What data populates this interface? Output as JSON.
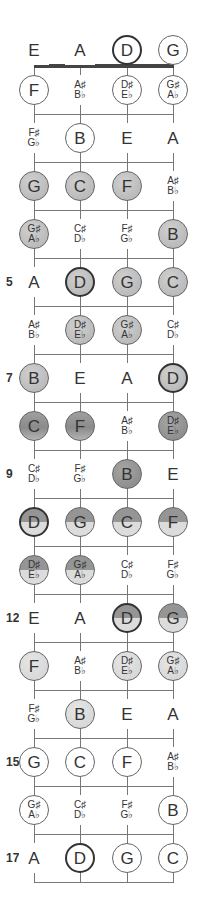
{
  "diagram": {
    "strings": [
      "E",
      "A",
      "D",
      "G"
    ],
    "string_x": [
      34,
      80,
      127,
      173
    ],
    "open_row_y": 50,
    "first_row_y": 90,
    "row_spacing": 48,
    "fills": {
      "white": "#ffffff",
      "light": "#dcdcdc",
      "mid": "#c0c0c0",
      "dark": "#8a8a8a",
      "split_top": "#959595",
      "split_bottom": "#dcdcdc"
    },
    "fret_numbers": [
      {
        "fret": 5,
        "label": "5"
      },
      {
        "fret": 7,
        "label": "7"
      },
      {
        "fret": 9,
        "label": "9"
      },
      {
        "fret": 12,
        "label": "12"
      },
      {
        "fret": 15,
        "label": "15"
      },
      {
        "fret": 17,
        "label": "17"
      }
    ],
    "rows": [
      {
        "fret": 0,
        "notes": [
          {
            "name": "E",
            "circle": false
          },
          {
            "name": "A",
            "circle": false
          },
          {
            "name": "D",
            "circle": true,
            "root": true,
            "fill": "white"
          },
          {
            "name": "G",
            "circle": true,
            "fill": "white"
          }
        ]
      },
      {
        "fret": 1,
        "notes": [
          {
            "name": "F",
            "circle": true,
            "fill": "white"
          },
          {
            "sharp": "A♯",
            "flat": "B♭",
            "circle": false
          },
          {
            "sharp": "D♯",
            "flat": "E♭",
            "circle": true,
            "fill": "white"
          },
          {
            "sharp": "G♯",
            "flat": "A♭",
            "circle": true,
            "fill": "white"
          }
        ]
      },
      {
        "fret": 2,
        "notes": [
          {
            "sharp": "F♯",
            "flat": "G♭",
            "circle": false
          },
          {
            "name": "B",
            "circle": true,
            "fill": "white"
          },
          {
            "name": "E",
            "circle": false
          },
          {
            "name": "A",
            "circle": false
          }
        ]
      },
      {
        "fret": 3,
        "notes": [
          {
            "name": "G",
            "circle": true,
            "fill": "mid"
          },
          {
            "name": "C",
            "circle": true,
            "fill": "mid"
          },
          {
            "name": "F",
            "circle": true,
            "fill": "mid"
          },
          {
            "sharp": "A♯",
            "flat": "B♭",
            "circle": false
          }
        ]
      },
      {
        "fret": 4,
        "notes": [
          {
            "sharp": "G♯",
            "flat": "A♭",
            "circle": true,
            "fill": "mid"
          },
          {
            "sharp": "C♯",
            "flat": "D♭",
            "circle": false
          },
          {
            "sharp": "F♯",
            "flat": "G♭",
            "circle": false
          },
          {
            "name": "B",
            "circle": true,
            "fill": "mid"
          }
        ]
      },
      {
        "fret": 5,
        "notes": [
          {
            "name": "A",
            "circle": false
          },
          {
            "name": "D",
            "circle": true,
            "root": true,
            "fill": "mid"
          },
          {
            "name": "G",
            "circle": true,
            "fill": "mid"
          },
          {
            "name": "C",
            "circle": true,
            "fill": "mid"
          }
        ]
      },
      {
        "fret": 6,
        "notes": [
          {
            "sharp": "A♯",
            "flat": "B♭",
            "circle": false
          },
          {
            "sharp": "D♯",
            "flat": "E♭",
            "circle": true,
            "fill": "mid"
          },
          {
            "sharp": "G♯",
            "flat": "A♭",
            "circle": true,
            "fill": "mid"
          },
          {
            "sharp": "C♯",
            "flat": "D♭",
            "circle": false
          }
        ]
      },
      {
        "fret": 7,
        "notes": [
          {
            "name": "B",
            "circle": true,
            "fill": "mid"
          },
          {
            "name": "E",
            "circle": false
          },
          {
            "name": "A",
            "circle": false
          },
          {
            "name": "D",
            "circle": true,
            "root": true,
            "fill": "mid"
          }
        ]
      },
      {
        "fret": 8,
        "notes": [
          {
            "name": "C",
            "circle": true,
            "fill": "darkgrad"
          },
          {
            "name": "F",
            "circle": true,
            "fill": "darkgrad"
          },
          {
            "sharp": "A♯",
            "flat": "B♭",
            "circle": false
          },
          {
            "sharp": "D♯",
            "flat": "E♭",
            "circle": true,
            "fill": "dark"
          }
        ]
      },
      {
        "fret": 9,
        "notes": [
          {
            "sharp": "C♯",
            "flat": "D♭",
            "circle": false
          },
          {
            "sharp": "F♯",
            "flat": "G♭",
            "circle": false
          },
          {
            "name": "B",
            "circle": true,
            "fill": "dark"
          },
          {
            "name": "E",
            "circle": false
          }
        ]
      },
      {
        "fret": 10,
        "notes": [
          {
            "name": "D",
            "circle": true,
            "root": true,
            "fill": "split"
          },
          {
            "name": "G",
            "circle": true,
            "fill": "split"
          },
          {
            "name": "C",
            "circle": true,
            "fill": "split"
          },
          {
            "name": "F",
            "circle": true,
            "fill": "split"
          }
        ]
      },
      {
        "fret": 11,
        "notes": [
          {
            "sharp": "D♯",
            "flat": "E♭",
            "circle": true,
            "fill": "split"
          },
          {
            "sharp": "G♯",
            "flat": "A♭",
            "circle": true,
            "fill": "split"
          },
          {
            "sharp": "C♯",
            "flat": "D♭",
            "circle": false
          },
          {
            "sharp": "F♯",
            "flat": "G♭",
            "circle": false
          }
        ]
      },
      {
        "fret": 12,
        "notes": [
          {
            "name": "E",
            "circle": false
          },
          {
            "name": "A",
            "circle": false
          },
          {
            "name": "D",
            "circle": true,
            "root": true,
            "fill": "split"
          },
          {
            "name": "G",
            "circle": true,
            "fill": "split"
          }
        ]
      },
      {
        "fret": 13,
        "notes": [
          {
            "name": "F",
            "circle": true,
            "fill": "light"
          },
          {
            "sharp": "A♯",
            "flat": "B♭",
            "circle": false
          },
          {
            "sharp": "D♯",
            "flat": "E♭",
            "circle": true,
            "fill": "light"
          },
          {
            "sharp": "G♯",
            "flat": "A♭",
            "circle": true,
            "fill": "light"
          }
        ]
      },
      {
        "fret": 14,
        "notes": [
          {
            "sharp": "F♯",
            "flat": "G♭",
            "circle": false
          },
          {
            "name": "B",
            "circle": true,
            "fill": "light"
          },
          {
            "name": "E",
            "circle": false
          },
          {
            "name": "A",
            "circle": false
          }
        ]
      },
      {
        "fret": 15,
        "notes": [
          {
            "name": "G",
            "circle": true,
            "fill": "white"
          },
          {
            "name": "C",
            "circle": true,
            "fill": "white"
          },
          {
            "name": "F",
            "circle": true,
            "fill": "white"
          },
          {
            "sharp": "A♯",
            "flat": "B♭",
            "circle": false
          }
        ]
      },
      {
        "fret": 16,
        "notes": [
          {
            "sharp": "G♯",
            "flat": "A♭",
            "circle": true,
            "fill": "white"
          },
          {
            "sharp": "C♯",
            "flat": "D♭",
            "circle": false
          },
          {
            "sharp": "F♯",
            "flat": "G♭",
            "circle": false
          },
          {
            "name": "B",
            "circle": true,
            "fill": "white"
          }
        ]
      },
      {
        "fret": 17,
        "notes": [
          {
            "name": "A",
            "circle": false
          },
          {
            "name": "D",
            "circle": true,
            "root": true,
            "fill": "white"
          },
          {
            "name": "G",
            "circle": true,
            "fill": "white"
          },
          {
            "name": "C",
            "circle": true,
            "fill": "white"
          }
        ]
      }
    ]
  }
}
